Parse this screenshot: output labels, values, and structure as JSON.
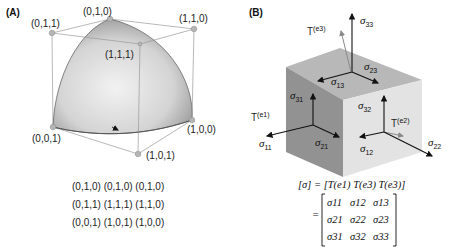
{
  "panel_a": {
    "label": "(A)",
    "vertices": {
      "v010": "(0,1,0)",
      "v011": "(0,1,1)",
      "v110": "(1,1,0)",
      "v111": "(1,1,1)",
      "v001": "(0,0,1)",
      "v100": "(1,0,0)",
      "v101": "(1,0,1)"
    },
    "grid_rows": [
      "(0,1,0) (0,1,0) (0,1,0)",
      "(0,1,1) (1,1,1) (1,1,0)",
      "(0,0,1) (1,0,1) (1,0,0)"
    ]
  },
  "panel_b": {
    "label": "(B)",
    "sigma": "σ",
    "subs": {
      "s33": "33",
      "s23": "23",
      "s13": "13",
      "s31": "31",
      "s32": "32",
      "s11": "11",
      "s21": "21",
      "s12": "12",
      "s22": "22"
    },
    "traction": {
      "T": "T",
      "e1": "(e1)",
      "e2": "(e2)",
      "e3": "(e3)"
    },
    "equation": {
      "lhs": "[σ] = [T(e1)   T(e3)   T(e3)]",
      "matrix": [
        [
          "σ11",
          "σ12",
          "σ13"
        ],
        [
          "σ21",
          "σ22",
          "σ23"
        ],
        [
          "σ31",
          "σ32",
          "σ33"
        ]
      ],
      "equals": "="
    }
  },
  "colors": {
    "cube_top": "#b8b8b8",
    "cube_left": "#8f8f8f",
    "cube_right": "#e2e2e2",
    "surface_light": "#e8e8e8",
    "surface_dark": "#8a8a8a",
    "vertex_dot": "#b0b0b0",
    "traction_arrow": "#8a8a8a"
  }
}
